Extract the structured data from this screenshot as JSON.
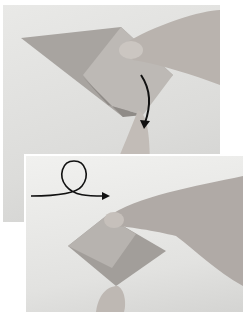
{
  "figure": {
    "panels": [
      {
        "id": "step-1",
        "caption": "",
        "arrow": "curved-fold-arrow",
        "colors": {
          "paper": "#a8a4a0",
          "paper_light": "#bdb9b5",
          "skin": "#b9b3ae",
          "background": "#e4e4e2"
        }
      },
      {
        "id": "step-2",
        "caption": "",
        "arrow": "turn-over-loop-arrow",
        "colors": {
          "paper": "#a29e9a",
          "paper_light": "#b7b3af",
          "skin": "#b0aaa6",
          "background": "#ececea"
        }
      }
    ]
  }
}
